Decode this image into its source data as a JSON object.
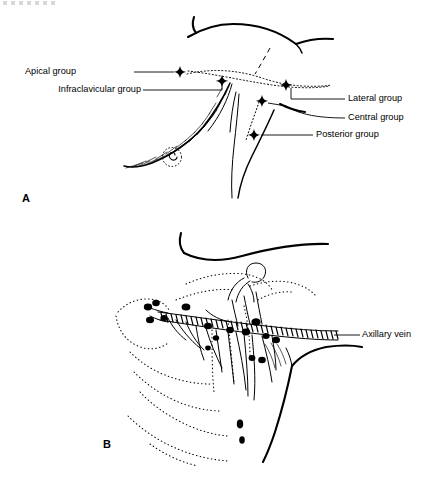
{
  "figure": {
    "panels": [
      {
        "letter": "A",
        "description": "Anterolateral view of the axilla showing the five groups of axillary lymph nodes marked with diamond symbols",
        "labels": [
          {
            "id": "apical",
            "text": "Apical group"
          },
          {
            "id": "infraclavicular",
            "text": "Infraclavicular group"
          },
          {
            "id": "lateral",
            "text": "Lateral group"
          },
          {
            "id": "central",
            "text": "Central group"
          },
          {
            "id": "posterior",
            "text": "Posterior group"
          }
        ],
        "marker_count": 5,
        "marker_shape": "diamond"
      },
      {
        "letter": "B",
        "description": "Deeper dissection view showing the axillary vein, its tributaries and the associated lymph nodes overlying the ribs",
        "labels": [
          {
            "id": "axillary-vein",
            "text": "Axillary vein"
          }
        ],
        "marker_count": 1,
        "marker_shape": "leader-line"
      }
    ]
  },
  "colors": {
    "ink": "#000000",
    "background": "#ffffff",
    "smudge": "#b9b9b9"
  }
}
